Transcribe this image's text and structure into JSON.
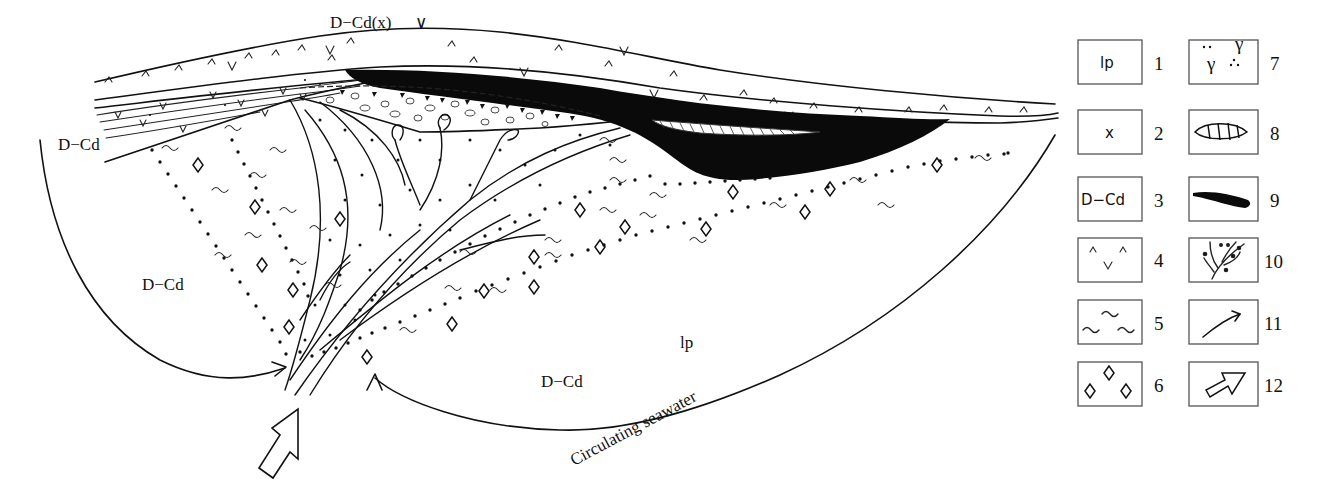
{
  "diagram": {
    "type": "geological cross-section (mineralization model)",
    "labels": {
      "top_volcanic": "D−Cd(x)",
      "left_upper": "D−Cd",
      "left_lower": "D−Cd",
      "bottom_center": "D−Cd",
      "bottom_right": "lp",
      "flow": "Circulating seawater"
    }
  },
  "legend": {
    "items": [
      {
        "num": "1",
        "symbol": "lp",
        "icon": "text-lp"
      },
      {
        "num": "2",
        "symbol": "x",
        "icon": "text-x"
      },
      {
        "num": "3",
        "symbol": "D−Cd",
        "icon": "text-d-cd"
      },
      {
        "num": "4",
        "symbol": "",
        "icon": "volcanic-v-pattern-icon"
      },
      {
        "num": "5",
        "symbol": "",
        "icon": "wavy-line-pattern-icon"
      },
      {
        "num": "6",
        "symbol": "",
        "icon": "diamond-pattern-icon"
      },
      {
        "num": "7",
        "symbol": "",
        "icon": "gamma-dot-pattern-icon"
      },
      {
        "num": "8",
        "symbol": "",
        "icon": "hatched-lens-icon"
      },
      {
        "num": "9",
        "symbol": "",
        "icon": "black-orebody-icon"
      },
      {
        "num": "10",
        "symbol": "",
        "icon": "stockwork-vein-icon"
      },
      {
        "num": "11",
        "symbol": "",
        "icon": "flow-arrow-icon"
      },
      {
        "num": "12",
        "symbol": "",
        "icon": "hollow-arrow-icon"
      }
    ]
  }
}
